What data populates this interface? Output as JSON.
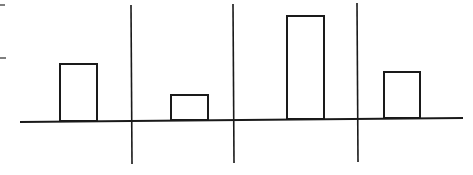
{
  "diagram": {
    "stroke_color": "#1a1a1a",
    "background": "#ffffff",
    "baseline": {
      "x1": 20,
      "y1": 122,
      "x2": 463,
      "y2": 118
    },
    "dividers": [
      {
        "x1": 131,
        "y1": 5,
        "x2": 132,
        "y2": 164
      },
      {
        "x1": 233,
        "y1": 4,
        "x2": 234,
        "y2": 163
      },
      {
        "x1": 357,
        "y1": 3,
        "x2": 358,
        "y2": 162
      }
    ],
    "bars": [
      {
        "label": "",
        "x": 60,
        "y": 64,
        "width": 37,
        "height": 57,
        "relative_height": 57
      },
      {
        "label": "",
        "x": 171,
        "y": 95,
        "width": 37,
        "height": 25,
        "relative_height": 26
      },
      {
        "label": "",
        "x": 287,
        "y": 16,
        "width": 37,
        "height": 103,
        "relative_height": 104
      },
      {
        "label": "",
        "x": 384,
        "y": 72,
        "width": 36,
        "height": 46,
        "relative_height": 47
      }
    ],
    "edge_ticks": [
      {
        "x1": 0,
        "y1": 5,
        "x2": 5,
        "y2": 5
      },
      {
        "x1": 0,
        "y1": 58,
        "x2": 6,
        "y2": 58
      }
    ]
  }
}
